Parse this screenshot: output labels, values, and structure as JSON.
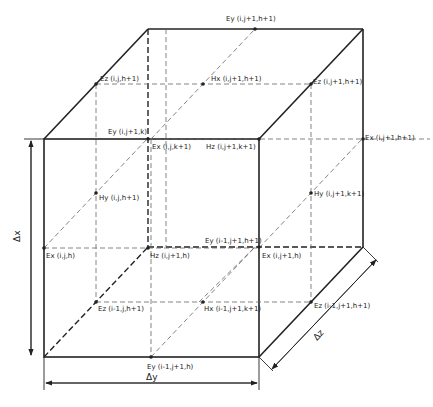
{
  "diagram": {
    "labels": [
      {
        "id": "ey-top",
        "text": "Ey (i,j+1,h+1)",
        "x": 226,
        "y": 19
      },
      {
        "id": "ez-back-left",
        "text": "Ez (i,j,h+1)",
        "x": 100,
        "y": 79
      },
      {
        "id": "hx-top",
        "text": "Hx (i,j+1,h+1)",
        "x": 211,
        "y": 79
      },
      {
        "id": "ez-back-right",
        "text": "Ez (i,j+1,h+1)",
        "x": 313,
        "y": 79
      },
      {
        "id": "ey-front-top",
        "text": "Ey (i,j+1,k)",
        "x": 108,
        "y": 127
      },
      {
        "id": "ex-top-left",
        "text": "Ex (i,j,k+1)",
        "x": 152,
        "y": 144
      },
      {
        "id": "hz-top-right",
        "text": "Hz (i,j+1,k+1)",
        "x": 205,
        "y": 144
      },
      {
        "id": "ex-top-right",
        "text": "Ex (i,j+1,h+1)",
        "x": 365,
        "y": 139
      },
      {
        "id": "hy-left",
        "text": "Hy (i,j,h+1)",
        "x": 95,
        "y": 198
      },
      {
        "id": "hy-right",
        "text": "Hy (i,j+1,k+1)",
        "x": 313,
        "y": 194
      },
      {
        "id": "ey-mid",
        "text": "Ey (i-1,j+1,h+1)",
        "x": 205,
        "y": 238
      },
      {
        "id": "ex-left",
        "text": "Ex (i,j,h)",
        "x": 46,
        "y": 253
      },
      {
        "id": "hz-mid",
        "text": "Hz (i,j+1,h)",
        "x": 150,
        "y": 253
      },
      {
        "id": "ex-right",
        "text": "Ex (i,j+1,h)",
        "x": 262,
        "y": 253
      },
      {
        "id": "ez-bottom-left",
        "text": "Ez (i-1,j,h+1)",
        "x": 98,
        "y": 305
      },
      {
        "id": "hx-bottom",
        "text": "Hx (i-1,j+1,k+1)",
        "x": 204,
        "y": 305
      },
      {
        "id": "ez-bottom-right",
        "text": "Ez (i-1,j+1,h+1)",
        "x": 314,
        "y": 302
      },
      {
        "id": "ey-bottom",
        "text": "Ey (i-1,j+1,h)",
        "x": 147,
        "y": 363
      }
    ],
    "dimensions": {
      "dx": "Δx",
      "dy": "Δy",
      "dz": "Δz"
    },
    "colors": {
      "line": "#222222",
      "dashed": "#555555",
      "background": "#ffffff"
    }
  }
}
